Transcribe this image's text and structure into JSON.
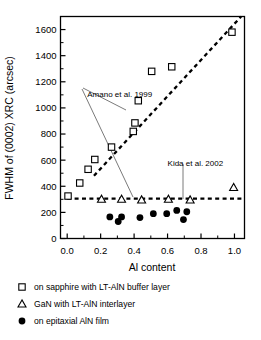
{
  "chart_data": {
    "type": "scatter",
    "title": "",
    "xlabel": "Al content",
    "ylabel": "FWHM of (0002) XRC (arcsec)",
    "xlim": [
      -0.04,
      1.06
    ],
    "ylim": [
      0,
      1700
    ],
    "xticks": [
      0.0,
      0.2,
      0.4,
      0.6,
      0.8,
      1.0
    ],
    "xticklabels": [
      "0.0",
      "0.2",
      "0.4",
      "0.6",
      "0.8",
      "1.0"
    ],
    "yticks": [
      0,
      200,
      400,
      600,
      800,
      1000,
      1200,
      1400,
      1600
    ],
    "yticklabels": [
      "0",
      "200",
      "400",
      "600",
      "800",
      "1000",
      "1200",
      "1400",
      "1600"
    ],
    "xminorticks": [
      0.1,
      0.3,
      0.5,
      0.7,
      0.9
    ],
    "yminorticks": [
      100,
      300,
      500,
      700,
      900,
      1100,
      1300,
      1500
    ],
    "grid": false,
    "legend_position": "below-axes",
    "series": [
      {
        "name": "on sapphire with LT-AlN buffer layer",
        "marker": "open-square",
        "points": [
          {
            "x": 0.005,
            "y": 325
          },
          {
            "x": 0.075,
            "y": 425
          },
          {
            "x": 0.125,
            "y": 530
          },
          {
            "x": 0.165,
            "y": 605
          },
          {
            "x": 0.265,
            "y": 700
          },
          {
            "x": 0.395,
            "y": 820
          },
          {
            "x": 0.405,
            "y": 885
          },
          {
            "x": 0.425,
            "y": 1055
          },
          {
            "x": 0.505,
            "y": 1280
          },
          {
            "x": 0.625,
            "y": 1315
          },
          {
            "x": 0.985,
            "y": 1580
          }
        ]
      },
      {
        "name": "GaN with LT-AlN interlayer",
        "marker": "open-triangle",
        "points": [
          {
            "x": 0.205,
            "y": 300
          },
          {
            "x": 0.325,
            "y": 300
          },
          {
            "x": 0.445,
            "y": 295
          },
          {
            "x": 0.605,
            "y": 300
          },
          {
            "x": 0.735,
            "y": 295
          },
          {
            "x": 0.995,
            "y": 390
          }
        ]
      },
      {
        "name": "on epitaxial AlN film",
        "marker": "filled-circle",
        "points": [
          {
            "x": 0.255,
            "y": 165
          },
          {
            "x": 0.305,
            "y": 130
          },
          {
            "x": 0.325,
            "y": 165
          },
          {
            "x": 0.435,
            "y": 160
          },
          {
            "x": 0.515,
            "y": 190
          },
          {
            "x": 0.595,
            "y": 190
          },
          {
            "x": 0.655,
            "y": 215
          },
          {
            "x": 0.695,
            "y": 145
          },
          {
            "x": 0.715,
            "y": 205
          }
        ]
      }
    ],
    "trendlines": [
      {
        "name": "sapphire-trend",
        "style": "dashed",
        "from": {
          "x": 0.16,
          "y": 480
        },
        "to": {
          "x": 1.04,
          "y": 1700
        }
      },
      {
        "name": "interlayer-trend",
        "style": "dashed",
        "from": {
          "x": 0.0,
          "y": 305
        },
        "to": {
          "x": 1.05,
          "y": 305
        }
      }
    ],
    "annotations": [
      {
        "text": "Amano et al. 1999",
        "x": 0.12,
        "y": 1085
      },
      {
        "text": "Kida et al. 2002",
        "x": 0.6,
        "y": 555
      }
    ]
  },
  "legend": {
    "items": [
      {
        "marker": "open-square",
        "label": "on sapphire with LT-AlN buffer layer"
      },
      {
        "marker": "open-triangle",
        "label": "GaN with LT-AlN interlayer"
      },
      {
        "marker": "filled-circle",
        "label": "on epitaxial AlN film"
      }
    ]
  }
}
